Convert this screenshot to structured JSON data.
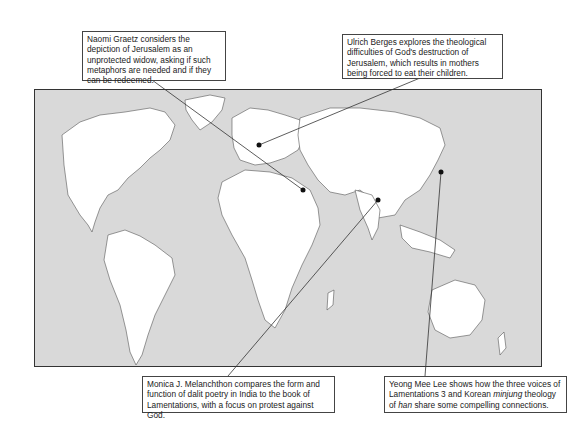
{
  "map": {
    "ocean_color": "#d9d9d9",
    "land_color": "#ffffff",
    "border_color": "#555555"
  },
  "callouts": [
    {
      "id": "graetz",
      "text": "Naomi Graetz considers the depiction of Jerusalem as an unprotected widow, asking if such metaphors are needed and if they can be redeemed.",
      "location": "Jerusalem / Egypt region"
    },
    {
      "id": "berges",
      "text": "Ulrich Berges explores the theological difficulties of God's destruction of Jerusalem, which results in mothers being forced to eat their children.",
      "location": "Germany"
    },
    {
      "id": "melanchthon",
      "text": "Monica J. Melanchthon compares the form and function of dalit poetry in India to the book of Lamentations, with a focus on protest against God.",
      "location": "India"
    },
    {
      "id": "lee",
      "text_parts": [
        "Yeong Mee Lee shows how the three voices of Lamentations 3 and Korean ",
        "minjung",
        " theology of ",
        "han",
        " share some compelling connections."
      ],
      "location": "Korea"
    }
  ]
}
